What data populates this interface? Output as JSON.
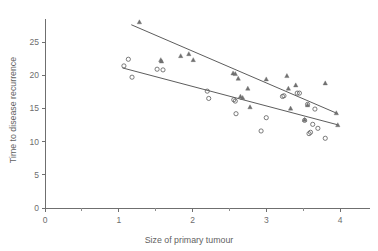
{
  "chart_data": {
    "type": "scatter",
    "title": "",
    "xlabel": "Size of primary tumour",
    "ylabel": "Time to disease recurrence",
    "xlim": [
      0,
      4.4
    ],
    "ylim": [
      0,
      28.5
    ],
    "xticks": [
      0,
      1,
      2,
      3,
      4
    ],
    "xticklabels": [
      "0",
      "1",
      "2",
      "3",
      "4"
    ],
    "xminorticks": [
      0.5,
      1.5,
      2.5,
      3.5
    ],
    "yticks": [
      0,
      5,
      10,
      15,
      20,
      25
    ],
    "yticklabels": [
      "0",
      "5",
      "10",
      "15",
      "20",
      "25"
    ],
    "grid": false,
    "legend": "none",
    "series": [
      {
        "name": "circles",
        "marker": "open-circle",
        "color": "#5a5a5a",
        "points": [
          [
            1.07,
            21.4
          ],
          [
            1.13,
            22.4
          ],
          [
            1.18,
            19.7
          ],
          [
            1.52,
            20.9
          ],
          [
            1.6,
            20.8
          ],
          [
            2.2,
            17.6
          ],
          [
            2.22,
            16.5
          ],
          [
            2.56,
            16.3
          ],
          [
            2.58,
            16.1
          ],
          [
            2.59,
            14.2
          ],
          [
            2.93,
            11.6
          ],
          [
            3.0,
            13.6
          ],
          [
            3.22,
            16.8
          ],
          [
            3.24,
            16.9
          ],
          [
            3.42,
            17.3
          ],
          [
            3.45,
            17.3
          ],
          [
            3.52,
            13.2
          ],
          [
            3.56,
            15.6
          ],
          [
            3.58,
            11.2
          ],
          [
            3.6,
            11.4
          ],
          [
            3.63,
            12.6
          ],
          [
            3.66,
            14.9
          ],
          [
            3.7,
            12.0
          ],
          [
            3.8,
            10.5
          ]
        ]
      },
      {
        "name": "triangles",
        "marker": "filled-triangle",
        "color": "#707070",
        "points": [
          [
            1.28,
            28.0
          ],
          [
            1.57,
            22.3
          ],
          [
            1.58,
            22.1
          ],
          [
            1.84,
            22.9
          ],
          [
            1.95,
            23.2
          ],
          [
            2.01,
            22.3
          ],
          [
            2.55,
            20.3
          ],
          [
            2.58,
            20.2
          ],
          [
            2.62,
            19.5
          ],
          [
            2.65,
            16.8
          ],
          [
            2.68,
            16.6
          ],
          [
            2.75,
            18.0
          ],
          [
            2.78,
            15.2
          ],
          [
            3.0,
            19.4
          ],
          [
            3.28,
            19.9
          ],
          [
            3.3,
            18.0
          ],
          [
            3.33,
            15.0
          ],
          [
            3.4,
            18.5
          ],
          [
            3.52,
            13.3
          ],
          [
            3.56,
            15.5
          ],
          [
            3.8,
            18.8
          ],
          [
            3.95,
            14.3
          ],
          [
            3.97,
            12.5
          ]
        ]
      }
    ],
    "fit_lines": [
      {
        "name": "upper-fit-line",
        "x_start": 1.17,
        "y_start": 27.6,
        "x_end": 3.97,
        "y_end": 14.2
      },
      {
        "name": "lower-fit-line",
        "x_start": 1.05,
        "y_start": 21.1,
        "x_end": 3.98,
        "y_end": 12.5
      }
    ]
  }
}
